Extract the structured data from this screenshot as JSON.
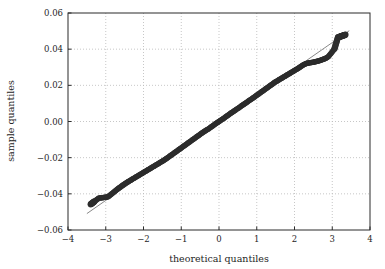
{
  "chart_data": {
    "type": "scatter",
    "title": "",
    "xlabel": "theoretical quantiles",
    "ylabel": "sample quantiles",
    "xlim": [
      -4,
      4
    ],
    "ylim": [
      -0.06,
      0.06
    ],
    "xticks": [
      -4,
      -3,
      -2,
      -1,
      0,
      1,
      2,
      3,
      4
    ],
    "xticklabels": [
      "−4",
      "−3",
      "−2",
      "−1",
      "0",
      "1",
      "2",
      "3",
      "4"
    ],
    "yticks": [
      -0.06,
      -0.04,
      -0.02,
      0.0,
      0.02,
      0.04,
      0.06
    ],
    "yticklabels": [
      "−0.06",
      "−0.04",
      "−0.02",
      "0.00",
      "0.02",
      "0.04",
      "0.06"
    ],
    "grid": true,
    "legend": null,
    "marker_color": "#2d2d2d",
    "reference_line_color": "#7a7a7a",
    "reference_line": {
      "slope": 0.01455,
      "intercept": 0.0,
      "x_start": -3.5,
      "x_end": 3.45
    },
    "series": [
      {
        "name": "quantile points",
        "x": [
          -3.4,
          -3.18,
          -3.12,
          -3.08,
          -3.05,
          -3.01,
          -2.98,
          -2.95,
          -2.92,
          -2.89,
          -2.86,
          -2.83,
          -2.8,
          -2.76,
          -2.72,
          -2.68,
          -2.64,
          -2.6,
          -2.56,
          -2.52,
          -2.48,
          -2.44,
          -2.4,
          -2.36,
          -2.32,
          -2.28,
          -2.24,
          -2.2,
          -2.16,
          -2.12,
          -2.08,
          -2.04,
          -2.0,
          -1.96,
          -1.92,
          -1.88,
          -1.84,
          -1.8,
          -1.76,
          -1.72,
          -1.68,
          -1.64,
          -1.6,
          -1.56,
          -1.52,
          -1.48,
          -1.44,
          -1.4,
          -1.36,
          -1.32,
          -1.28,
          -1.24,
          -1.2,
          -1.16,
          -1.12,
          -1.08,
          -1.04,
          -1.0,
          -0.96,
          -0.92,
          -0.88,
          -0.84,
          -0.8,
          -0.76,
          -0.72,
          -0.68,
          -0.64,
          -0.6,
          -0.56,
          -0.52,
          -0.48,
          -0.44,
          -0.4,
          -0.36,
          -0.32,
          -0.28,
          -0.24,
          -0.2,
          -0.16,
          -0.12,
          -0.08,
          -0.04,
          0.0,
          0.04,
          0.08,
          0.12,
          0.16,
          0.2,
          0.24,
          0.28,
          0.32,
          0.36,
          0.4,
          0.44,
          0.48,
          0.52,
          0.56,
          0.6,
          0.64,
          0.68,
          0.72,
          0.76,
          0.8,
          0.84,
          0.88,
          0.92,
          0.96,
          1.0,
          1.04,
          1.08,
          1.12,
          1.16,
          1.2,
          1.24,
          1.28,
          1.32,
          1.36,
          1.4,
          1.44,
          1.48,
          1.52,
          1.56,
          1.6,
          1.64,
          1.68,
          1.72,
          1.76,
          1.8,
          1.84,
          1.88,
          1.92,
          1.96,
          2.0,
          2.04,
          2.08,
          2.12,
          2.16,
          2.2,
          2.24,
          2.28,
          2.32,
          2.36,
          2.4,
          2.44,
          2.48,
          2.52,
          2.56,
          2.6,
          2.64,
          2.68,
          2.72,
          2.76,
          2.8,
          2.84,
          2.88,
          2.91,
          2.94,
          2.97,
          3.0,
          3.03,
          3.06,
          3.15,
          3.35
        ],
        "y": [
          -0.0458,
          -0.0423,
          -0.0422,
          -0.0421,
          -0.042,
          -0.0419,
          -0.0418,
          -0.0417,
          -0.0413,
          -0.0408,
          -0.0403,
          -0.0398,
          -0.0393,
          -0.0386,
          -0.0379,
          -0.0372,
          -0.0366,
          -0.036,
          -0.0354,
          -0.0348,
          -0.0342,
          -0.0337,
          -0.0332,
          -0.0327,
          -0.0322,
          -0.0317,
          -0.0312,
          -0.0307,
          -0.0302,
          -0.0297,
          -0.0292,
          -0.0287,
          -0.0282,
          -0.0277,
          -0.0272,
          -0.0267,
          -0.0262,
          -0.0257,
          -0.0252,
          -0.0247,
          -0.0242,
          -0.0237,
          -0.0232,
          -0.0227,
          -0.0222,
          -0.0217,
          -0.0212,
          -0.0206,
          -0.02,
          -0.0194,
          -0.0188,
          -0.0182,
          -0.0176,
          -0.017,
          -0.0164,
          -0.0158,
          -0.0152,
          -0.0146,
          -0.014,
          -0.0134,
          -0.0128,
          -0.0122,
          -0.0116,
          -0.011,
          -0.0104,
          -0.0098,
          -0.0092,
          -0.0086,
          -0.008,
          -0.0074,
          -0.0068,
          -0.0062,
          -0.0056,
          -0.0051,
          -0.0046,
          -0.0041,
          -0.0035,
          -0.0029,
          -0.0023,
          -0.0017,
          -0.0011,
          -0.0005,
          0.0,
          0.0006,
          0.0012,
          0.0017,
          0.0023,
          0.0029,
          0.0035,
          0.0041,
          0.0047,
          0.0052,
          0.0058,
          0.0064,
          0.007,
          0.0075,
          0.0081,
          0.0087,
          0.0093,
          0.0098,
          0.0104,
          0.011,
          0.0116,
          0.0121,
          0.0127,
          0.0133,
          0.0139,
          0.0145,
          0.0151,
          0.0157,
          0.0163,
          0.0169,
          0.0175,
          0.0181,
          0.0187,
          0.0193,
          0.0199,
          0.0205,
          0.0211,
          0.0217,
          0.0222,
          0.0227,
          0.0232,
          0.0237,
          0.0242,
          0.0247,
          0.0252,
          0.0257,
          0.0262,
          0.0267,
          0.0272,
          0.0277,
          0.0282,
          0.0287,
          0.0292,
          0.0297,
          0.0303,
          0.0309,
          0.0314,
          0.0318,
          0.0321,
          0.0323,
          0.0325,
          0.0326,
          0.0327,
          0.0329,
          0.0331,
          0.0333,
          0.0335,
          0.0338,
          0.0341,
          0.0344,
          0.0347,
          0.0351,
          0.0356,
          0.0362,
          0.037,
          0.0378,
          0.0386,
          0.0394,
          0.0402,
          0.0465,
          0.048
        ]
      }
    ]
  }
}
